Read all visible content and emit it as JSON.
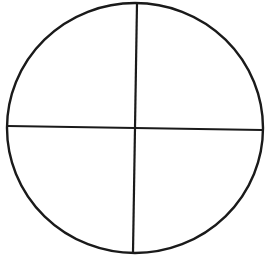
{
  "diagram": {
    "type": "circle-quadrants",
    "stroke_color": "#1a1a1a",
    "background": "#ffffff",
    "circle": {
      "cx": 135,
      "cy": 128,
      "rx": 128,
      "ry": 125,
      "stroke_width": 2.4
    },
    "vertical_line": {
      "x1": 137,
      "y1": 3,
      "x2": 133,
      "y2": 252,
      "stroke_width": 2.2
    },
    "horizontal_line": {
      "x1": 8,
      "y1": 126,
      "x2": 262,
      "y2": 130,
      "stroke_width": 2.2
    }
  }
}
